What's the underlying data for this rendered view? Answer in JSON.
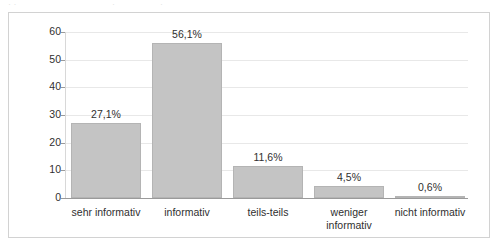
{
  "top_remnants": {
    "a": "· ·",
    "b": "·",
    "c": "·"
  },
  "chart_data": {
    "type": "bar",
    "title": "",
    "subtitle": "",
    "xlabel": "",
    "ylabel": "",
    "categories": [
      "sehr informativ",
      "informativ",
      "teils-teils",
      "weniger\ninformativ",
      "nicht informativ"
    ],
    "values": [
      27.1,
      56.1,
      11.6,
      4.5,
      0.6
    ],
    "value_labels": [
      "27,1%",
      "56,1%",
      "11,6%",
      "4,5%",
      "0,6%"
    ],
    "ylim": [
      0,
      60
    ],
    "yticks": [
      0,
      10,
      20,
      30,
      40,
      50,
      60
    ],
    "ytick_labels": [
      "0",
      "10",
      "20",
      "30",
      "40",
      "50",
      "60"
    ],
    "grid": true,
    "grid_axis": "y",
    "legend": false,
    "legend_position": "none",
    "bar_color": "#c4c4c4",
    "bar_border_color": "#b4b4b4",
    "axis_color": "#9a9a9a",
    "grid_color": "#e8e8e8",
    "frame_color": "#d2d2d2",
    "background_color": "#ffffff",
    "text_color": "#2f2f2f"
  }
}
